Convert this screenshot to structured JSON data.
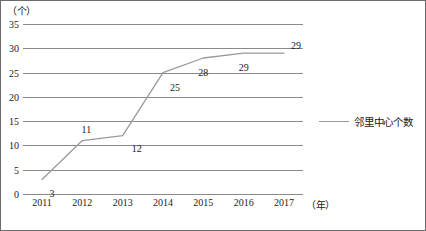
{
  "chart_data": {
    "type": "line",
    "title": "",
    "xlabel": "（年）",
    "ylabel": "（个）",
    "categories": [
      "2011",
      "2012",
      "2013",
      "2014",
      "2015",
      "2016",
      "2017"
    ],
    "series": [
      {
        "name": "邻里中心个数",
        "values": [
          3,
          11,
          12,
          25,
          28,
          29,
          29
        ],
        "color": "#9a9a9a"
      }
    ],
    "point_labels": [
      "3",
      "11",
      "12",
      "25",
      "28",
      "29",
      "29"
    ],
    "ylim": [
      0,
      35
    ],
    "ytick_values": [
      35,
      30,
      25,
      20,
      15,
      10,
      5,
      0
    ],
    "ytick_labels": [
      "35",
      "30",
      "25",
      "20",
      "15",
      "10",
      "5",
      "0"
    ],
    "grid": true,
    "legend_position": "right",
    "legend_entries": [
      "邻里中心个数"
    ]
  },
  "axes": {
    "y_unit_caption": "（个）",
    "x_unit_caption": "（年）"
  },
  "colors": {
    "grid": "#8a8a8a",
    "line": "#9a9a9a",
    "text": "#1a1a1a",
    "frame": "#6b6b6b"
  }
}
